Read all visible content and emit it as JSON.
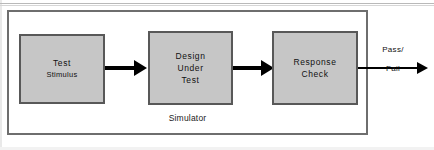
{
  "diagram": {
    "container": {
      "label": "Simulator"
    },
    "blocks": [
      {
        "id": "test-stimulus",
        "line1": "Test",
        "line2": "Stimulus"
      },
      {
        "id": "design-under-test",
        "line1": "Design",
        "line2": "Under",
        "line3": "Test"
      },
      {
        "id": "response-check",
        "line1": "Response",
        "line2": "Check"
      }
    ],
    "output": {
      "label_top": "Pass/",
      "label_bottom": "Fail"
    },
    "colors": {
      "block_fill": "#c6c6c6",
      "block_border": "#585858",
      "container_border": "#6e6e6e",
      "arrow": "#000000",
      "text": "#111111",
      "background": "#ffffff"
    }
  }
}
